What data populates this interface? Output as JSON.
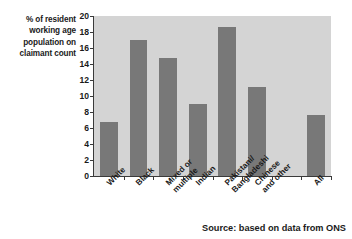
{
  "chart_data": {
    "type": "bar",
    "title": "",
    "xlabel": "",
    "ylabel": "% of resident working age population on claimant count",
    "ylim": [
      0,
      20
    ],
    "ytick_step": 2,
    "grid": false,
    "legend": "none",
    "bar_color": "#787878",
    "plot_background": "#d4d4d4",
    "axis_color": "#3a3a3a",
    "categories": [
      "White",
      "Black",
      "Mixed or\nmultiple",
      "Indian",
      "Pakistani/\nBangladeshi",
      "Chinese\nand other",
      "",
      "All"
    ],
    "values": [
      6.8,
      17.0,
      14.7,
      9.0,
      18.6,
      11.1,
      null,
      7.6
    ],
    "yticks": [
      "0",
      "2",
      "4",
      "6",
      "8",
      "10",
      "12",
      "14",
      "16",
      "18",
      "20"
    ],
    "annotations": [
      "Source: based on data from ONS"
    ]
  },
  "axis_caption": {
    "line1": "% of resident",
    "line2": "working age",
    "line3": "population on",
    "line4": "claimant count"
  },
  "source": {
    "text": "Source: based on data from ONS"
  }
}
